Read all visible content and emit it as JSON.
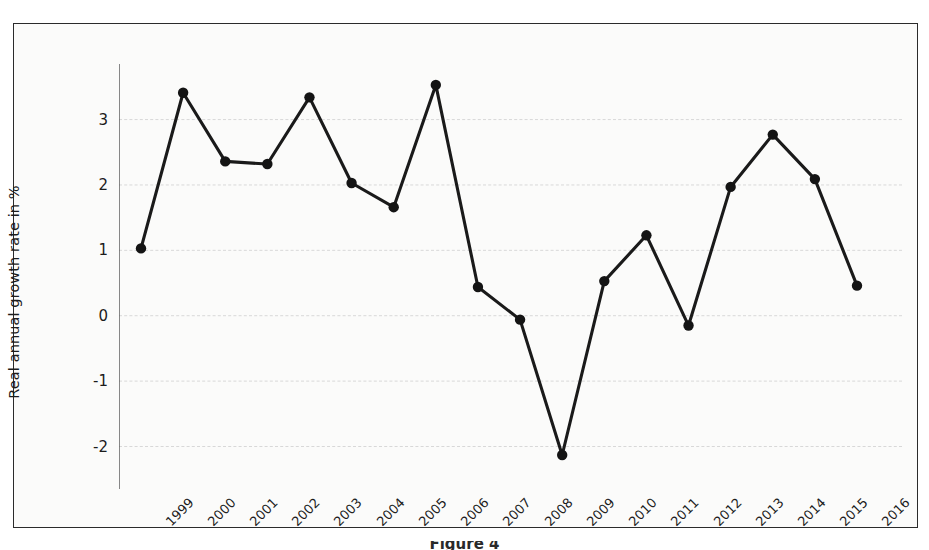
{
  "figure": {
    "y_axis_title": "Real annual growth rate in %",
    "caption": "Figure 4"
  },
  "chart_data": {
    "type": "line",
    "title": "",
    "subtitle": "",
    "xlabel": "",
    "ylabel": "Real annual growth rate in %",
    "categories": [
      "1999",
      "2000",
      "2001",
      "2002",
      "2003",
      "2004",
      "2005",
      "2006",
      "2007",
      "2008",
      "2009",
      "2010",
      "2011",
      "2012",
      "2013",
      "2014",
      "2015",
      "2016"
    ],
    "values": [
      1.03,
      3.41,
      2.36,
      2.32,
      3.34,
      2.03,
      1.66,
      3.53,
      0.44,
      -0.06,
      -2.13,
      0.53,
      1.23,
      -0.15,
      1.97,
      2.77,
      2.09,
      0.46
    ],
    "series": [
      {
        "name": "Real annual growth rate in %",
        "values": [
          1.03,
          3.41,
          2.36,
          2.32,
          3.34,
          2.03,
          1.66,
          3.53,
          0.44,
          -0.06,
          -2.13,
          0.53,
          1.23,
          -0.15,
          1.97,
          2.77,
          2.09,
          0.46
        ]
      }
    ],
    "ytick_labels": [
      "3",
      "2",
      "1",
      "0",
      "-1",
      "-2"
    ],
    "ytick_values": [
      3,
      2,
      1,
      0,
      -1,
      -2
    ],
    "ylim": [
      -2.65,
      3.85
    ],
    "grid": "horizontal",
    "legend": "none",
    "line_color": "#1a1a1a",
    "marker": "circle",
    "marker_color": "#141414",
    "background_color": "#fbfbfa",
    "grid_color": "#d8d8d8",
    "axis_color": "#555555"
  }
}
